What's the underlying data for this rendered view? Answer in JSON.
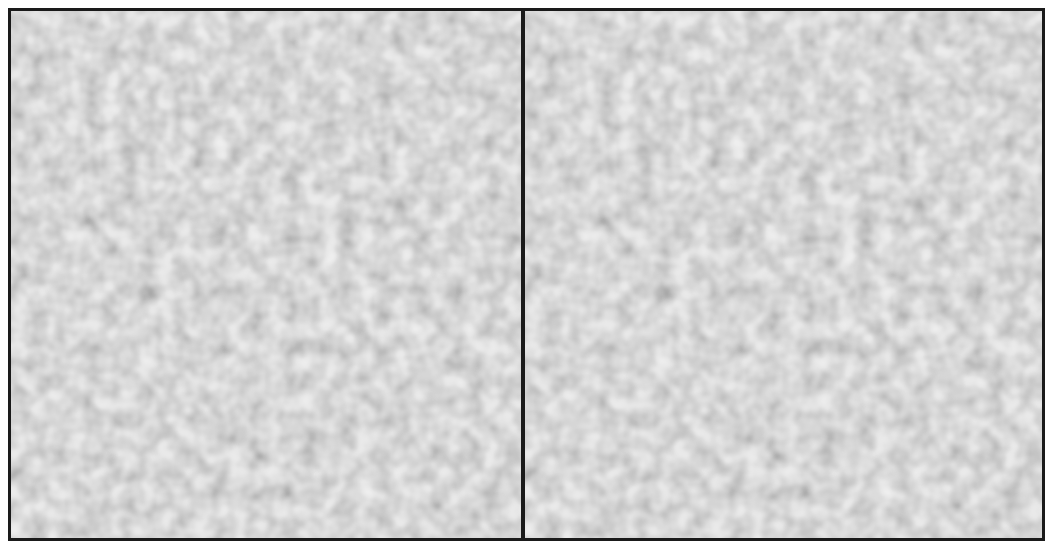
{
  "figure": {
    "panels": [
      {
        "id": "left",
        "label": "left-texture-panel"
      },
      {
        "id": "right",
        "label": "right-texture-panel"
      }
    ],
    "colors": {
      "frame": "#1a1a1a",
      "texture_light": "#eeeeee",
      "texture_dark": "#555555",
      "background": "#ffffff"
    },
    "caption": ""
  }
}
